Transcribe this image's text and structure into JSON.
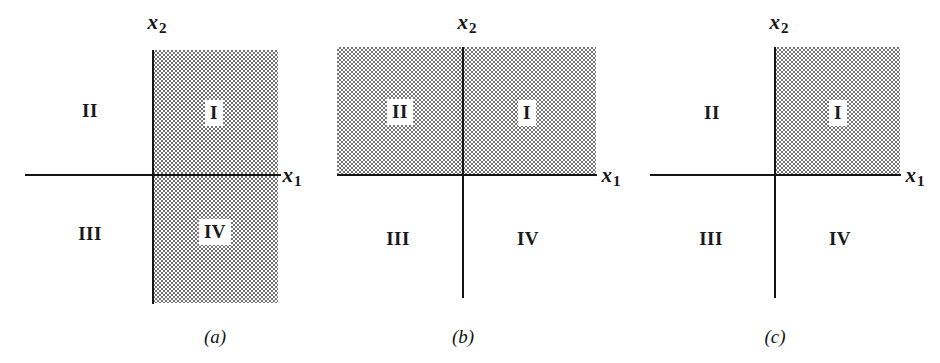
{
  "figure": {
    "width": 940,
    "height": 363,
    "background": "#ffffff",
    "ink_color": "#141414",
    "shade_color": "#6e6e6e"
  },
  "panels": [
    {
      "id": "a",
      "caption": "(a)",
      "caption_x": 215,
      "caption_y": 336,
      "origin_x": 153,
      "origin_y": 175,
      "axis_h": {
        "x": 25,
        "y": 174,
        "width": 256,
        "height": 2
      },
      "axis_v": {
        "x": 152,
        "y": 50,
        "width": 2,
        "height": 254
      },
      "shade": {
        "x": 153,
        "y": 50,
        "width": 125,
        "height": 253
      },
      "shaded_quadrants": "I and IV",
      "xlabel": {
        "base": "x",
        "sub": "1",
        "x": 292,
        "y": 177
      },
      "ylabel": {
        "base": "x",
        "sub": "2",
        "x": 157,
        "y": 24
      },
      "quadrants": [
        {
          "label": "I",
          "x": 214,
          "y": 113,
          "boxed": true
        },
        {
          "label": "II",
          "x": 90,
          "y": 110,
          "boxed": false
        },
        {
          "label": "III",
          "x": 90,
          "y": 233,
          "boxed": false
        },
        {
          "label": "IV",
          "x": 215,
          "y": 232,
          "boxed": true
        }
      ]
    },
    {
      "id": "b",
      "caption": "(b)",
      "caption_x": 463,
      "caption_y": 336,
      "origin_x": 463,
      "origin_y": 175,
      "axis_h": {
        "x": 337,
        "y": 174,
        "width": 260,
        "height": 2
      },
      "axis_v": {
        "x": 462,
        "y": 47,
        "width": 2,
        "height": 251
      },
      "shade": {
        "x": 337,
        "y": 47,
        "width": 259,
        "height": 127
      },
      "shaded_quadrants": "I and II",
      "xlabel": {
        "base": "x",
        "sub": "1",
        "x": 611,
        "y": 177
      },
      "ylabel": {
        "base": "x",
        "sub": "2",
        "x": 467,
        "y": 24
      },
      "quadrants": [
        {
          "label": "I",
          "x": 527,
          "y": 113,
          "boxed": true
        },
        {
          "label": "II",
          "x": 400,
          "y": 112,
          "boxed": true
        },
        {
          "label": "III",
          "x": 398,
          "y": 238,
          "boxed": false
        },
        {
          "label": "IV",
          "x": 528,
          "y": 238,
          "boxed": false
        }
      ]
    },
    {
      "id": "c",
      "caption": "(c)",
      "caption_x": 775,
      "caption_y": 336,
      "origin_x": 775,
      "origin_y": 175,
      "axis_h": {
        "x": 650,
        "y": 174,
        "width": 251,
        "height": 2
      },
      "axis_v": {
        "x": 774,
        "y": 47,
        "width": 2,
        "height": 251
      },
      "shade": {
        "x": 775,
        "y": 47,
        "width": 125,
        "height": 127
      },
      "shaded_quadrants": "I",
      "xlabel": {
        "base": "x",
        "sub": "1",
        "x": 915,
        "y": 177
      },
      "ylabel": {
        "base": "x",
        "sub": "2",
        "x": 779,
        "y": 24
      },
      "quadrants": [
        {
          "label": "I",
          "x": 838,
          "y": 113,
          "boxed": true
        },
        {
          "label": "II",
          "x": 712,
          "y": 112,
          "boxed": false
        },
        {
          "label": "III",
          "x": 711,
          "y": 238,
          "boxed": false
        },
        {
          "label": "IV",
          "x": 840,
          "y": 238,
          "boxed": false
        }
      ]
    }
  ]
}
